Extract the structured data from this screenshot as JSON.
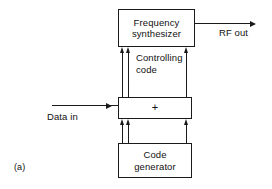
{
  "figure": {
    "caption": "(a)",
    "blocks": [
      {
        "id": "frequency-synthesizer",
        "line1": "Frequency",
        "line2": "synthesizer"
      },
      {
        "id": "adder",
        "symbol": "+"
      },
      {
        "id": "code-generator",
        "line1": "Code",
        "line2": "generator"
      }
    ],
    "labels": {
      "controlling_code_line1": "Controlling",
      "controlling_code_line2": "code",
      "rf_out": "RF out",
      "data_in": "Data in"
    },
    "colors": {
      "stroke": "#1a1a1a",
      "background": "#ffffff",
      "text": "#111111"
    }
  }
}
